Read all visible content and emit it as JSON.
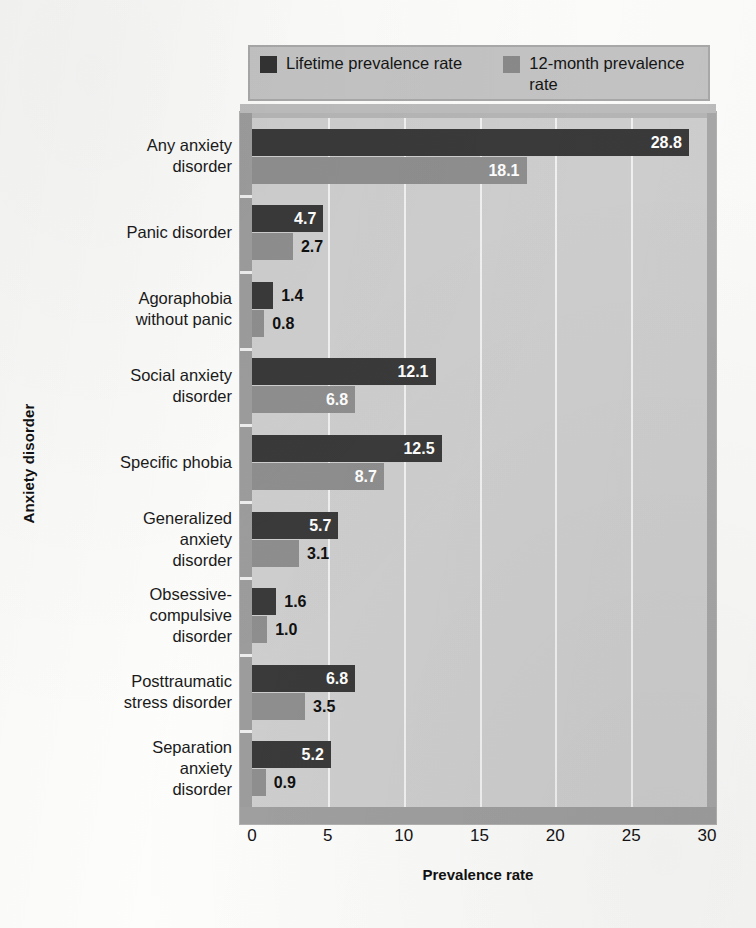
{
  "chart_data": {
    "type": "bar",
    "orientation": "horizontal",
    "title": "",
    "xlabel": "Prevalence rate",
    "ylabel": "Anxiety disorder",
    "xlim": [
      0,
      30
    ],
    "xticks": [
      "0",
      "5",
      "10",
      "15",
      "20",
      "25",
      "30"
    ],
    "grid": true,
    "legend_position": "top",
    "categories": [
      "Any anxiety\ndisorder",
      "Panic disorder",
      "Agoraphobia\nwithout panic",
      "Social anxiety\ndisorder",
      "Specific phobia",
      "Generalized\nanxiety\ndisorder",
      "Obsessive-\ncompulsive\ndisorder",
      "Posttraumatic\nstress disorder",
      "Separation\nanxiety\ndisorder"
    ],
    "series": [
      {
        "name": "Lifetime prevalence rate",
        "color": "#3a3a3a",
        "values": [
          28.8,
          4.7,
          1.4,
          12.1,
          12.5,
          5.7,
          1.6,
          6.8,
          5.2
        ],
        "labels": [
          "28.8",
          "4.7",
          "1.4",
          "12.1",
          "12.5",
          "5.7",
          "1.6",
          "6.8",
          "5.2"
        ]
      },
      {
        "name": "12-month prevalence rate",
        "color": "#8f8f8f",
        "values": [
          18.1,
          2.7,
          0.8,
          6.8,
          8.7,
          3.1,
          1.0,
          3.5,
          0.9
        ],
        "labels": [
          "18.1",
          "2.7",
          "0.8",
          "6.8",
          "8.7",
          "3.1",
          "1.0",
          "3.5",
          "0.9"
        ]
      }
    ]
  },
  "legend": {
    "lifetime_label": "Lifetime prevalence rate",
    "twelve_month_label": "12-month prevalence rate"
  },
  "axes": {
    "x_title": "Prevalence rate",
    "y_title": "Anxiety disorder"
  }
}
